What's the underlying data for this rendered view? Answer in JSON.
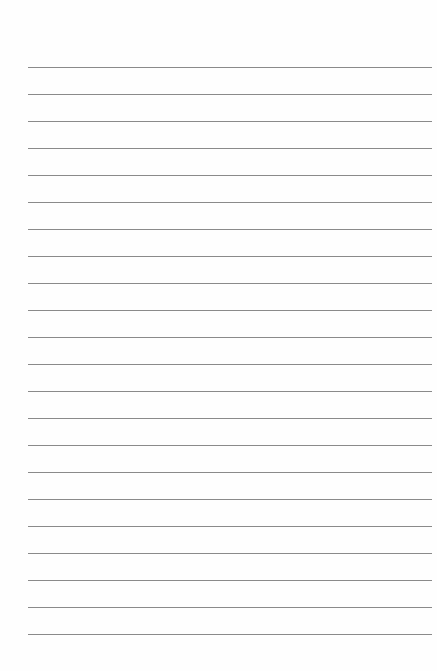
{
  "page": {
    "type": "lined paper",
    "line_count": 22,
    "first_line_y": 67,
    "line_spacing": 27,
    "line_color": "#8a8a8a",
    "background": "#fefefe"
  }
}
